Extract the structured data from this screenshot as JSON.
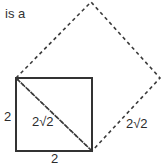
{
  "figure": {
    "prose_text": "is a",
    "background_color": "#ffffff",
    "stroke_color": "#333333",
    "dash_color": "#3a3a3a",
    "text_color": "#2b2b2b",
    "labels": {
      "left_side": "2",
      "bottom_side": "2",
      "inner_diagonal": "2√2",
      "outer_side": "2√2"
    },
    "shapes": {
      "solid_square": {
        "name": "solid-square",
        "style": "solid",
        "points": "16,78 92,78 92,151 16,151"
      },
      "dashed_diamond": {
        "name": "dashed-diamond",
        "style": "dashed",
        "points": "16,78 91,2 160,78 92,151"
      },
      "dashed_diagonal": {
        "name": "dashed-diagonal",
        "style": "dashed",
        "x1": 16,
        "y1": 78,
        "x2": 92,
        "y2": 151
      }
    }
  }
}
